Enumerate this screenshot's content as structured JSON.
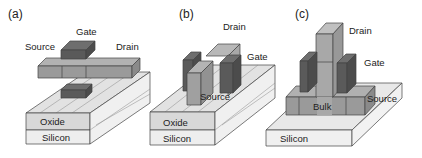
{
  "panels": [
    {
      "id": "a",
      "label": "(a)",
      "terminals": {
        "gate": "Gate",
        "source": "Source",
        "drain": "Drain"
      },
      "layers": {
        "oxide": "Oxide",
        "silicon": "Silicon"
      }
    },
    {
      "id": "b",
      "label": "(b)",
      "terminals": {
        "gate": "Gate",
        "source": "Source",
        "drain": "Drain"
      },
      "layers": {
        "oxide": "Oxide",
        "silicon": "Silicon"
      }
    },
    {
      "id": "c",
      "label": "(c)",
      "terminals": {
        "gate": "Gate",
        "source": "Source",
        "drain": "Drain",
        "bulk": "Bulk"
      },
      "layers": {
        "silicon": "Silicon"
      }
    }
  ],
  "colors": {
    "gate_dark": "#5a5a5a",
    "gate_top": "#6e6e6e",
    "sd_front": "#9a9a9a",
    "sd_top": "#b4b4b4",
    "oxide_front": "#d9d9d9",
    "silicon_front": "#eeeeee",
    "substrate_top": "#e4e4e4"
  }
}
